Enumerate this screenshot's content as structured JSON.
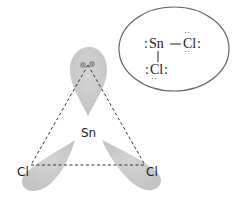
{
  "diagram": {
    "central_atom_label": "Sn",
    "left_atom_label": "Cl",
    "right_atom_label": "Cl",
    "lone_pair_label": "lone pair",
    "colors": {
      "lobe": "#c8c8c8",
      "lone_pair_dot": "#9a9a9a",
      "bond_dashes": "#333333",
      "ellipse_stroke": "#666666",
      "text": "#1a1a1a"
    }
  },
  "lewis_structure": {
    "central": "Sn",
    "bonded_right": "Cl",
    "bonded_below": "Cl",
    "sn_lone_pair": ":",
    "cl_lone_pairs": ":"
  }
}
